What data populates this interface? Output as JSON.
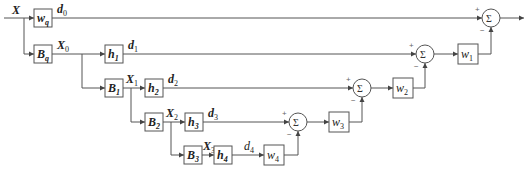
{
  "diagram": {
    "input_label": "X",
    "colors": {
      "line": "#555555",
      "text": "#222222",
      "background": "#ffffff"
    },
    "blocks": [
      {
        "id": "wq",
        "label": "w",
        "sub": "q"
      },
      {
        "id": "Bq",
        "label": "B",
        "sub": "q"
      },
      {
        "id": "h1",
        "label": "h",
        "sub": "1"
      },
      {
        "id": "B1",
        "label": "B",
        "sub": "1"
      },
      {
        "id": "h2",
        "label": "h",
        "sub": "2"
      },
      {
        "id": "B2",
        "label": "B",
        "sub": "2"
      },
      {
        "id": "h3",
        "label": "h",
        "sub": "3"
      },
      {
        "id": "B3",
        "label": "B",
        "sub": "3"
      },
      {
        "id": "h4",
        "label": "h",
        "sub": "4"
      },
      {
        "id": "w4",
        "label": "w",
        "sub": "4"
      },
      {
        "id": "w3",
        "label": "w",
        "sub": "3"
      },
      {
        "id": "w2",
        "label": "w",
        "sub": "2"
      },
      {
        "id": "w1",
        "label": "w",
        "sub": "1"
      }
    ],
    "signals": [
      {
        "label": "d",
        "sub": "0"
      },
      {
        "label": "X",
        "sub": "0"
      },
      {
        "label": "d",
        "sub": "1"
      },
      {
        "label": "X",
        "sub": "1"
      },
      {
        "label": "d",
        "sub": "2"
      },
      {
        "label": "X",
        "sub": "2"
      },
      {
        "label": "d",
        "sub": "3"
      },
      {
        "label": "X",
        "sub": "3"
      },
      {
        "label": "d",
        "sub": "4"
      }
    ],
    "summers": {
      "symbol": "Σ",
      "plus": "+",
      "minus": "−"
    }
  }
}
